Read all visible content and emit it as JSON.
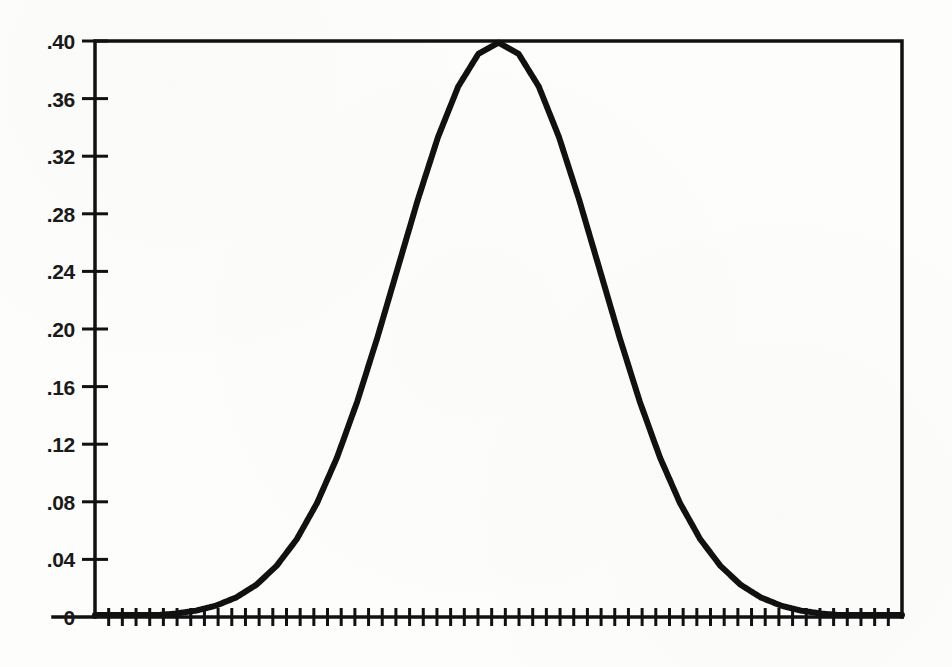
{
  "chart_data": {
    "type": "line",
    "title": "",
    "subtitle": "",
    "xlabel": "",
    "ylabel": "",
    "xlim": [
      -4,
      4
    ],
    "ylim": [
      0,
      0.4
    ],
    "grid": false,
    "legend": null,
    "curve_description": "standard normal probability density function",
    "y_tick_labels": [
      ".40",
      ".36",
      ".32",
      ".28",
      ".24",
      ".20",
      ".16",
      ".12",
      ".08",
      ".04",
      "0"
    ],
    "y_tick_values": [
      0.4,
      0.36,
      0.32,
      0.28,
      0.24,
      0.2,
      0.16,
      0.12,
      0.08,
      0.04,
      0
    ],
    "x_tick_labels": [],
    "x_tick_count": 59,
    "x_ticks_labeled": false,
    "peak_value": 0.4,
    "peak_x_fraction": 0.5,
    "series": [
      {
        "name": "normal density",
        "x": [
          -4.0,
          -3.8,
          -3.6,
          -3.4,
          -3.2,
          -3.0,
          -2.8,
          -2.6,
          -2.4,
          -2.2,
          -2.0,
          -1.8,
          -1.6,
          -1.4,
          -1.2,
          -1.0,
          -0.8,
          -0.6,
          -0.4,
          -0.2,
          0.0,
          0.2,
          0.4,
          0.6,
          0.8,
          1.0,
          1.2,
          1.4,
          1.6,
          1.8,
          2.0,
          2.2,
          2.4,
          2.6,
          2.8,
          3.0,
          3.2,
          3.4,
          3.6,
          3.8,
          4.0
        ],
        "values": [
          0.0001,
          0.0003,
          0.0006,
          0.0012,
          0.0024,
          0.0044,
          0.0079,
          0.0136,
          0.0224,
          0.0355,
          0.054,
          0.079,
          0.1109,
          0.1497,
          0.1942,
          0.242,
          0.2897,
          0.3332,
          0.3683,
          0.391,
          0.3989,
          0.391,
          0.3683,
          0.3332,
          0.2897,
          0.242,
          0.1942,
          0.1497,
          0.1109,
          0.079,
          0.054,
          0.0355,
          0.0224,
          0.0136,
          0.0079,
          0.0044,
          0.0024,
          0.0012,
          0.0006,
          0.0003,
          0.0001
        ]
      }
    ],
    "colors": {
      "curve": "#111111",
      "axis": "#111111",
      "background": "#fdfdfc",
      "tick_label": "#1a1a1a"
    },
    "geometry": {
      "plot_left": 95,
      "plot_right": 902,
      "plot_top": 41,
      "plot_bottom": 617,
      "curve_stroke_width": 6,
      "frame_stroke_width": 3.5,
      "tick_length": 9,
      "y_tick_length": 13
    }
  }
}
